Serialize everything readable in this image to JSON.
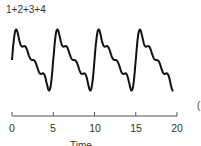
{
  "chart_data": {
    "type": "line",
    "title": "1+2+3+4",
    "xlabel": "Time (s)",
    "ylabel": "",
    "xlim": [
      0,
      20
    ],
    "x_ticks": [
      0,
      5,
      10,
      15,
      20
    ],
    "x_tick_labels": [
      "0",
      "5",
      "10",
      "15",
      "20"
    ],
    "grid": false,
    "legend": null,
    "series": [
      {
        "name": "1+2+3+4",
        "description": "Sum of first four harmonics (sawtooth-like Fourier partial sum), period 5",
        "formula": "sum_{k=1..4} sin(2*pi*k*t/5)/k",
        "color": "#111111"
      }
    ]
  },
  "labels": {
    "title": "1+2+3+4",
    "xlabel": "Time",
    "right_fragment": "("
  },
  "ticks": [
    "0",
    "5",
    "10",
    "15",
    "20"
  ]
}
